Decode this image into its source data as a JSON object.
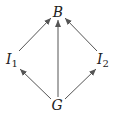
{
  "diagram": {
    "nodes": [
      {
        "id": "B",
        "label": "B",
        "sub": "",
        "x": 58,
        "y": 12
      },
      {
        "id": "I1",
        "label": "I",
        "sub": "1",
        "x": 12,
        "y": 60
      },
      {
        "id": "I2",
        "label": "I",
        "sub": "2",
        "x": 103,
        "y": 60
      },
      {
        "id": "G",
        "label": "G",
        "sub": "",
        "x": 57,
        "y": 105
      }
    ],
    "edges": [
      {
        "from": "I1",
        "to": "B"
      },
      {
        "from": "G",
        "to": "B"
      },
      {
        "from": "I2",
        "to": "B"
      },
      {
        "from": "G",
        "to": "I1"
      },
      {
        "from": "G",
        "to": "I2"
      }
    ],
    "arrow_color": "#555555"
  }
}
